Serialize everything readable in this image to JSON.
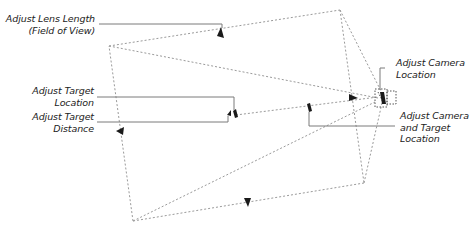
{
  "diagram": {
    "labels": {
      "lens": {
        "line1": "Adjust Lens Length",
        "line2": "(Field of View)"
      },
      "target_location": {
        "line1": "Adjust Target",
        "line2": "Location"
      },
      "target_distance": {
        "line1": "Adjust Target",
        "line2": "Distance"
      },
      "camera_location": {
        "line1": "Adjust Camera",
        "line2": "Location"
      },
      "camera_and_target": {
        "line1": "Adjust Camera",
        "line2": "and Target",
        "line3": "Location"
      }
    },
    "colors": {
      "frustum_line": "#9a9a9a",
      "leader_line": "#7a7a7a",
      "handle": "#1a1a1a",
      "text": "#222222"
    }
  }
}
